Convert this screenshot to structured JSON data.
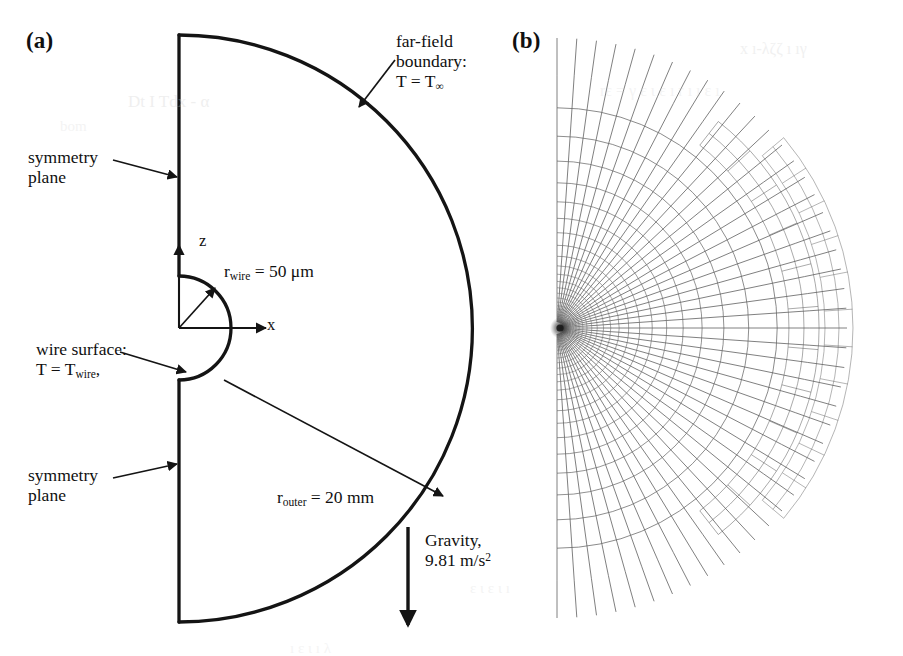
{
  "figure": {
    "panels": [
      {
        "tag": "(a)",
        "name": "computational-domain-schematic",
        "labels": {
          "far_field": {
            "line1": "far-field",
            "line2": "boundary:",
            "line3_prefix": "T = T",
            "line3_sub": "∞"
          },
          "symmetry_top": {
            "line1": "symmetry",
            "line2": "plane"
          },
          "symmetry_bottom": {
            "line1": "symmetry",
            "line2": "plane"
          },
          "wire_surface": {
            "line1": "wire surface:",
            "line2_prefix": "T = T",
            "line2_sub": "wire",
            "line2_suffix": ","
          },
          "r_wire": {
            "prefix": "r",
            "sub": "wire",
            "value": " = 50 μm"
          },
          "r_outer": {
            "prefix": "r",
            "sub": "outer",
            "value": " = 20 mm"
          },
          "gravity": {
            "line1": "Gravity,",
            "line2_prefix": "9.81 m/s",
            "line2_sup": "2"
          },
          "axis_z": "z",
          "axis_x": "x"
        }
      },
      {
        "tag": "(b)",
        "name": "computational-mesh",
        "description": "radial structured mesh, half-disc domain, refined toward wire surface"
      }
    ]
  },
  "geometry": {
    "panel_a": {
      "center_x": 179,
      "center_y": 328,
      "outer_radius": 287,
      "wire_radius": 52,
      "top_y": 35,
      "bottom_y": 622,
      "stroke": "#141414",
      "stroke_width": 3.3
    },
    "panel_b": {
      "center_x": 557,
      "center_y": 328,
      "outer_radius": 290,
      "wire_radius": 6,
      "radial_lines": 46,
      "arc_lines": 26,
      "stroke": "#5c5c5c",
      "stroke_width": 0.85,
      "detached_bands": [
        {
          "r_inner": 232,
          "r_outer": 262,
          "angle_start": -52,
          "angle_end": 52
        },
        {
          "r_inner": 268,
          "r_outer": 296,
          "angle_start": -40,
          "angle_end": 40
        }
      ]
    }
  },
  "annotations": {
    "arrows": [
      {
        "name": "far-field-arrow",
        "from": [
          395,
          60
        ],
        "to": [
          359,
          107
        ]
      },
      {
        "name": "symmetry-top-arrow",
        "from": [
          113,
          160
        ],
        "to": [
          177,
          177
        ]
      },
      {
        "name": "symmetry-bottom-arrow",
        "from": [
          113,
          478
        ],
        "to": [
          177,
          464
        ]
      },
      {
        "name": "wire-surface-arrow",
        "from": [
          120,
          352
        ],
        "to": [
          186,
          372
        ]
      },
      {
        "name": "r-wire-arrow",
        "from": [
          179,
          328
        ],
        "to": [
          215,
          288
        ]
      },
      {
        "name": "r-outer-arrow",
        "from": [
          224,
          380
        ],
        "to": [
          443,
          496
        ]
      },
      {
        "name": "gravity-arrow",
        "from": [
          408,
          527
        ],
        "to": [
          408,
          625
        ]
      }
    ]
  },
  "scan_artifacts": {
    "enabled": true,
    "color": "#cccccc",
    "items": [
      {
        "text": "Dt I Tdx - α",
        "x": 128,
        "y": 92,
        "size": 17,
        "opacity": 0.3
      },
      {
        "text": "bom",
        "x": 60,
        "y": 118,
        "size": 15,
        "opacity": 0.22
      },
      {
        "text": "x  ı-λζζ ı ıγ",
        "x": 740,
        "y": 40,
        "size": 16,
        "opacity": 0.28
      },
      {
        "text": "rε = γ ε ι ε ı r ı ı ε ı",
        "x": 600,
        "y": 82,
        "size": 16,
        "opacity": 0.22
      },
      {
        "text": "ε ι ε ι ı",
        "x": 470,
        "y": 580,
        "size": 15,
        "opacity": 0.22
      },
      {
        "text": "ı ε ι ı λ",
        "x": 290,
        "y": 640,
        "size": 15,
        "opacity": 0.2
      }
    ]
  }
}
